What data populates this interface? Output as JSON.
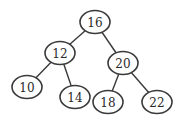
{
  "diagram": {
    "type": "binary-search-tree",
    "colors": {
      "background": "#ffffff",
      "stroke": "#3a3a3a",
      "text": "#2a2a2a"
    },
    "nodes": [
      {
        "id": "n16",
        "label": "16",
        "cx": 95,
        "cy": 22
      },
      {
        "id": "n12",
        "label": "12",
        "cx": 60,
        "cy": 53
      },
      {
        "id": "n20",
        "label": "20",
        "cx": 123,
        "cy": 63
      },
      {
        "id": "n10",
        "label": "10",
        "cx": 27,
        "cy": 87
      },
      {
        "id": "n14",
        "label": "14",
        "cx": 75,
        "cy": 97
      },
      {
        "id": "n18",
        "label": "18",
        "cx": 108,
        "cy": 102
      },
      {
        "id": "n22",
        "label": "22",
        "cx": 157,
        "cy": 102
      }
    ],
    "edges": [
      {
        "from": "n16",
        "to": "n12"
      },
      {
        "from": "n16",
        "to": "n20"
      },
      {
        "from": "n12",
        "to": "n10"
      },
      {
        "from": "n12",
        "to": "n14"
      },
      {
        "from": "n20",
        "to": "n18"
      },
      {
        "from": "n20",
        "to": "n22"
      }
    ]
  }
}
